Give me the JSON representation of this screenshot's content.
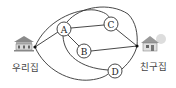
{
  "diagram": {
    "title": "",
    "places": {
      "home": {
        "label": "우리집",
        "icon": "house-icon"
      },
      "friend": {
        "label": "친구집",
        "icon": "house-icon"
      }
    },
    "nodes": [
      {
        "id": "A",
        "label": "A"
      },
      {
        "id": "B",
        "label": "B"
      },
      {
        "id": "C",
        "label": "C"
      },
      {
        "id": "D",
        "label": "D"
      }
    ],
    "edges": [
      [
        "우리집",
        "A"
      ],
      [
        "우리집",
        "C"
      ],
      [
        "우리집",
        "D"
      ],
      [
        "A",
        "C"
      ],
      [
        "A",
        "B"
      ],
      [
        "A",
        "D"
      ],
      [
        "A",
        "친구집"
      ],
      [
        "B",
        "친구집"
      ],
      [
        "C",
        "친구집"
      ],
      [
        "D",
        "친구집"
      ]
    ],
    "colors": {
      "line": "#333333",
      "background": "#ffffff"
    }
  }
}
